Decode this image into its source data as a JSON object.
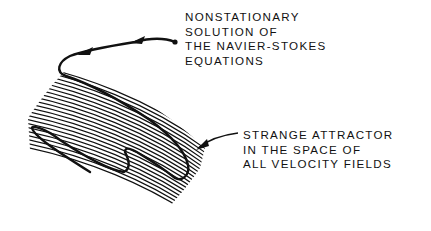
{
  "diagram": {
    "type": "illustration",
    "labels": {
      "solution": {
        "lines": [
          "NONSTATIONARY",
          "SOLUTION OF",
          "THE NAVIER-STOKES",
          "EQUATIONS"
        ]
      },
      "attractor": {
        "lines": [
          "STRANGE ATTRACTOR",
          "IN THE SPACE OF",
          "ALL VELOCITY FIELDS"
        ]
      }
    },
    "elements": [
      {
        "id": "trajectory",
        "description": "thick curve with arrowheads representing the nonstationary solution, starting at a dot and winding onto the attractor"
      },
      {
        "id": "attractor-band",
        "description": "hatched curved band of parallel lines representing the strange attractor"
      },
      {
        "id": "pointer-arrow",
        "description": "arrow from attractor label to the hatched band"
      }
    ],
    "colors": {
      "ink": "#111111",
      "background": "#ffffff"
    }
  }
}
